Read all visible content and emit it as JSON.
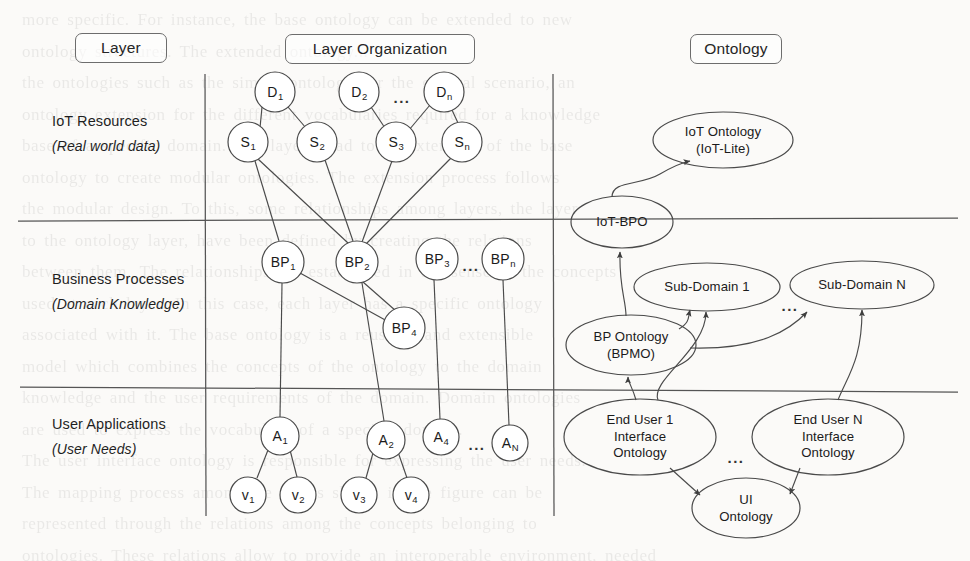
{
  "figure": {
    "background_text": "more specific. For instance, the base ontology can be extended to new\nontology structures. The extended ontology...\nthe ontologies such as the simple ontology for the general scenario, an\nontology extension for the different vocabularies required for a knowledge\nbase of a specific domain. The layers lead to an extension of the base\nontology to create modular ontologies. The extension process follows\nthe modular design. To this, some relationships among layers, the layer\nto the ontology layer, have been defined by creating the relations\nbetween them. The relationships are established in the sense of the concepts\nused at each layer. In this case, each layer has a specific ontology\nassociated with it. The base ontology is a reusable and extensible\nmodel which combines the concepts of the ontology to the domain\nknowledge and the user requirements of the domain. Domain ontologies\nare used to express the vocabulary of a specific domain.\nThe user interface ontology is responsible for expressing the user needs.\nThe mapping process among the layers shown in the figure can be\nrepresented through the relations among the concepts belonging to\nontologies. These relations allow to provide an interoperable environment, needed\nto enable the different applications and services for supporting the operated and\nuser needs. The modular ontology design and the definition of the relations."
  },
  "headers": [
    {
      "label": "Layer",
      "name": "header-layer"
    },
    {
      "label": "Layer Organization",
      "name": "header-layer-organization"
    },
    {
      "label": "Ontology",
      "name": "header-ontology"
    }
  ],
  "layers": [
    {
      "title": "IoT Resources",
      "subtitle": "(Real world data)"
    },
    {
      "title": "Business Processes",
      "subtitle": "(Domain Knowledge)"
    },
    {
      "title": "User Applications",
      "subtitle": "(User Needs)"
    }
  ],
  "graph_nodes": [
    {
      "id": "D1",
      "base": "D",
      "sub": "1",
      "cx": 275,
      "cy": 92,
      "r": 20
    },
    {
      "id": "D2",
      "base": "D",
      "sub": "2",
      "cx": 359,
      "cy": 92,
      "r": 20
    },
    {
      "id": "Dn",
      "base": "D",
      "sub": "n",
      "cx": 444,
      "cy": 92,
      "r": 20
    },
    {
      "id": "S1",
      "base": "S",
      "sub": "1",
      "cx": 248,
      "cy": 142,
      "r": 20
    },
    {
      "id": "S2",
      "base": "S",
      "sub": "2",
      "cx": 317,
      "cy": 142,
      "r": 20
    },
    {
      "id": "S3",
      "base": "S",
      "sub": "3",
      "cx": 396,
      "cy": 142,
      "r": 20
    },
    {
      "id": "Sn",
      "base": "S",
      "sub": "n",
      "cx": 462,
      "cy": 142,
      "r": 20
    },
    {
      "id": "BP1",
      "base": "BP",
      "sub": "1",
      "cx": 283,
      "cy": 262,
      "r": 21
    },
    {
      "id": "BP2",
      "base": "BP",
      "sub": "2",
      "cx": 357,
      "cy": 262,
      "r": 21
    },
    {
      "id": "BP3",
      "base": "BP",
      "sub": "3",
      "cx": 437,
      "cy": 259,
      "r": 21
    },
    {
      "id": "BPn",
      "base": "BP",
      "sub": "n",
      "cx": 503,
      "cy": 259,
      "r": 21
    },
    {
      "id": "BP4",
      "base": "BP",
      "sub": "4",
      "cx": 404,
      "cy": 328,
      "r": 21
    },
    {
      "id": "A1",
      "base": "A",
      "sub": "1",
      "cx": 280,
      "cy": 436,
      "r": 19
    },
    {
      "id": "A2",
      "base": "A",
      "sub": "2",
      "cx": 386,
      "cy": 440,
      "r": 19
    },
    {
      "id": "A4",
      "base": "A",
      "sub": "4",
      "cx": 441,
      "cy": 437,
      "r": 18
    },
    {
      "id": "AN",
      "base": "A",
      "sub": "N",
      "cx": 510,
      "cy": 443,
      "r": 18
    },
    {
      "id": "V1",
      "base": "v",
      "sub": "1",
      "cx": 248,
      "cy": 495,
      "r": 18
    },
    {
      "id": "V2",
      "base": "v",
      "sub": "2",
      "cx": 298,
      "cy": 495,
      "r": 18
    },
    {
      "id": "V3",
      "base": "v",
      "sub": "3",
      "cx": 359,
      "cy": 495,
      "r": 18
    },
    {
      "id": "V4",
      "base": "v",
      "sub": "4",
      "cx": 411,
      "cy": 495,
      "r": 18
    }
  ],
  "graph_ellipsis": [
    {
      "name": "ellipsis-d-row",
      "x": 402,
      "y": 97
    },
    {
      "name": "ellipsis-bp-row",
      "x": 471,
      "y": 265
    },
    {
      "name": "ellipsis-a-row",
      "x": 477,
      "y": 444
    }
  ],
  "ontology_nodes": [
    {
      "id": "iot-ontology",
      "lines": [
        "IoT Ontology",
        "(IoT-Lite)"
      ],
      "cx": 723,
      "cy": 140,
      "rx": 70,
      "ry": 28
    },
    {
      "id": "iot-bpo",
      "lines": [
        "IoT-BPO"
      ],
      "cx": 622,
      "cy": 222,
      "rx": 51,
      "ry": 26
    },
    {
      "id": "sub-domain-1",
      "lines": [
        "Sub-Domain 1"
      ],
      "cx": 707,
      "cy": 287,
      "rx": 73,
      "ry": 24
    },
    {
      "id": "sub-domain-n",
      "lines": [
        "Sub-Domain N"
      ],
      "cx": 862,
      "cy": 285,
      "rx": 72,
      "ry": 24
    },
    {
      "id": "bp-ontology",
      "lines": [
        "BP Ontology",
        "(BPMO)"
      ],
      "cx": 631,
      "cy": 345,
      "rx": 65,
      "ry": 30
    },
    {
      "id": "end-user-1-ontology",
      "lines": [
        "End User 1",
        "Interface",
        "Ontology"
      ],
      "cx": 640,
      "cy": 437,
      "rx": 76,
      "ry": 38
    },
    {
      "id": "end-user-n-ontology",
      "lines": [
        "End User N",
        "Interface",
        "Ontology"
      ],
      "cx": 828,
      "cy": 437,
      "rx": 76,
      "ry": 38
    },
    {
      "id": "ui-ontology",
      "lines": [
        "UI",
        "Ontology"
      ],
      "cx": 746,
      "cy": 508,
      "rx": 54,
      "ry": 30
    }
  ],
  "ontology_ellipsis": [
    {
      "name": "ellipsis-sub-domain",
      "x": 790,
      "y": 305
    },
    {
      "name": "ellipsis-end-user",
      "x": 736,
      "y": 457
    }
  ],
  "colors": {
    "stroke": "#4a4a4a",
    "text": "#1b1b1b",
    "paper": "#fbfaf8"
  }
}
